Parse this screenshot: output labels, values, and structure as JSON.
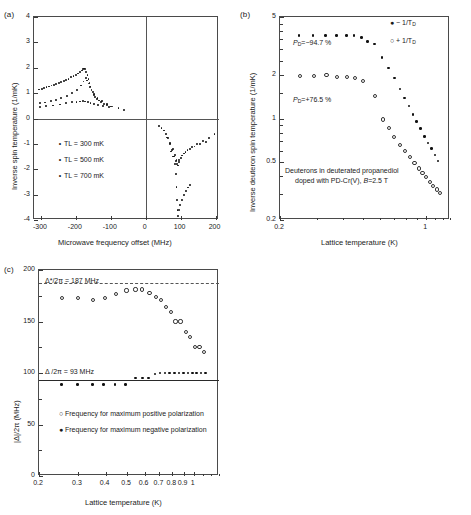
{
  "figure": {
    "panels": [
      "(a)",
      "(b)",
      "(c)"
    ]
  },
  "panel_a": {
    "tag": "(a)",
    "xlabel": "Microwave frequency offset (MHz)",
    "ylabel": "Inverse spin temperature (1/mK)",
    "xticks": [
      "-300",
      "-200",
      "-100",
      "0",
      "100",
      "200"
    ],
    "yticks": [
      "4",
      "3",
      "2",
      "1",
      "0",
      "-1",
      "-2",
      "-3",
      "-4"
    ],
    "legend": [
      {
        "marker": "dot",
        "label": "TL = 300 mK"
      },
      {
        "marker": "dot",
        "label": "TL = 500 mK"
      },
      {
        "marker": "dot",
        "label": "TL = 700 mK"
      }
    ]
  },
  "panel_b": {
    "tag": "(b)",
    "xlabel": "Lattice temperature (K)",
    "ylabel": "Inverse deuteron spin temperature (1/mK)",
    "xticks": [
      "0.2",
      "1"
    ],
    "yticks": [
      "5",
      "2",
      "1",
      "0.5",
      "0.2"
    ],
    "legend": [
      {
        "marker": "filled",
        "label": "− 1/T",
        "sub": "D"
      },
      {
        "marker": "open",
        "label": "+ 1/T",
        "sub": "D"
      }
    ],
    "annotations": {
      "neg_polarization": "P",
      "neg_polarization_sub": "D",
      "neg_polarization_val": "=−94.7 %",
      "pos_polarization": "P",
      "pos_polarization_sub": "D",
      "pos_polarization_val": "=+76.5 %",
      "caption_line1": "Deuterons in deuterated propanediol",
      "caption_line2_a": "doped with PD-Cr(V), ",
      "caption_line2_b": "B",
      "caption_line2_c": "=2.5 T"
    }
  },
  "panel_c": {
    "tag": "(c)",
    "xlabel": "Lattice temperature (K)",
    "ylabel": "|Δ|/2π  (MHz)",
    "xticks": [
      "0.2",
      "0.3",
      "0.4",
      "0.5",
      "0.6",
      "0.7",
      "0.8",
      "0.9",
      "1"
    ],
    "yticks": [
      "200",
      "150",
      "100",
      "50",
      "0"
    ],
    "annotations": {
      "upper_line": "Δ*/2π = 187 MHz",
      "lower_line": "Δ /2π = 93 MHz"
    },
    "legend": [
      {
        "marker": "open",
        "label": "Frequency for maximum positive polarization"
      },
      {
        "marker": "filled",
        "label": "Frequency for maximum negative polarization"
      }
    ]
  },
  "chart_data": [
    {
      "type": "scatter",
      "id": "panel_a",
      "title": "(a)",
      "xlabel": "Microwave frequency offset (MHz)",
      "ylabel": "Inverse spin temperature (1/mK)",
      "xlim": [
        -320,
        210
      ],
      "ylim": [
        -4,
        4
      ],
      "grid": false,
      "legend_position": "center-left",
      "series": [
        {
          "name": "TL = 300 mK",
          "marker": "dot",
          "points": [
            [
              -305,
              1.14
            ],
            [
              -298,
              1.17
            ],
            [
              -291,
              1.2
            ],
            [
              -284,
              1.23
            ],
            [
              -277,
              1.26
            ],
            [
              -270,
              1.3
            ],
            [
              -263,
              1.33
            ],
            [
              -256,
              1.37
            ],
            [
              -249,
              1.41
            ],
            [
              -242,
              1.45
            ],
            [
              -235,
              1.49
            ],
            [
              -228,
              1.53
            ],
            [
              -221,
              1.57
            ],
            [
              -214,
              1.62
            ],
            [
              -207,
              1.67
            ],
            [
              -200,
              1.72
            ],
            [
              -194,
              1.77
            ],
            [
              -188,
              1.83
            ],
            [
              -183,
              1.89
            ],
            [
              -179,
              1.94
            ],
            [
              -176,
              1.97
            ],
            [
              -173,
              1.95
            ],
            [
              -170,
              1.84
            ],
            [
              -167,
              1.7
            ],
            [
              -164,
              1.55
            ],
            [
              -161,
              1.4
            ],
            [
              -158,
              1.26
            ],
            [
              -155,
              1.14
            ],
            [
              -152,
              1.03
            ],
            [
              -149,
              0.94
            ],
            [
              -145,
              0.86
            ],
            [
              -140,
              0.78
            ],
            [
              -134,
              0.71
            ],
            [
              -127,
              0.64
            ],
            [
              -119,
              0.58
            ],
            [
              -110,
              0.52
            ],
            [
              -100,
              0.47
            ],
            [
              38,
              -0.28
            ],
            [
              45,
              -0.36
            ],
            [
              52,
              -0.47
            ],
            [
              58,
              -0.6
            ],
            [
              64,
              -0.78
            ],
            [
              70,
              -1.0
            ],
            [
              75,
              -1.25
            ],
            [
              79,
              -1.5
            ],
            [
              83,
              -1.8
            ],
            [
              86,
              -2.2
            ],
            [
              88,
              -2.7
            ],
            [
              90,
              -3.2
            ],
            [
              91,
              -3.6
            ],
            [
              92,
              -3.85
            ],
            [
              95,
              -3.6
            ],
            [
              99,
              -3.4
            ],
            [
              104,
              -3.2
            ],
            [
              110,
              -3.0
            ],
            [
              116,
              -2.85
            ],
            [
              122,
              -2.72
            ],
            [
              127,
              -2.62
            ]
          ]
        },
        {
          "name": "TL = 500 mK",
          "marker": "dot",
          "points": [
            [
              -302,
              0.6
            ],
            [
              -288,
              0.63
            ],
            [
              -272,
              0.68
            ],
            [
              -258,
              0.74
            ],
            [
              -242,
              0.81
            ],
            [
              -226,
              0.9
            ],
            [
              -210,
              1.02
            ],
            [
              -197,
              1.13
            ],
            [
              -186,
              1.3
            ],
            [
              -178,
              1.46
            ],
            [
              -172,
              1.6
            ],
            [
              -168,
              1.5
            ],
            [
              -164,
              1.38
            ],
            [
              -160,
              1.24
            ],
            [
              -155,
              1.1
            ],
            [
              -148,
              0.96
            ],
            [
              -138,
              0.82
            ],
            [
              -126,
              0.7
            ],
            [
              -112,
              0.58
            ],
            [
              -95,
              0.47
            ],
            [
              -78,
              0.4
            ],
            [
              -62,
              0.35
            ],
            [
              60,
              -0.75
            ],
            [
              70,
              -0.95
            ],
            [
              78,
              -1.2
            ],
            [
              84,
              -1.45
            ],
            [
              88,
              -1.65
            ],
            [
              92,
              -1.85
            ],
            [
              96,
              -1.72
            ],
            [
              102,
              -1.55
            ],
            [
              110,
              -1.38
            ],
            [
              120,
              -1.25
            ],
            [
              133,
              -1.12
            ],
            [
              148,
              -1.0
            ],
            [
              165,
              -0.88
            ],
            [
              182,
              -0.76
            ],
            [
              197,
              -0.62
            ]
          ]
        },
        {
          "name": "TL = 700 mK",
          "marker": "dot",
          "points": [
            [
              -303,
              0.46
            ],
            [
              -285,
              0.48
            ],
            [
              -265,
              0.51
            ],
            [
              -245,
              0.55
            ],
            [
              -228,
              0.6
            ],
            [
              -212,
              0.64
            ],
            [
              -198,
              0.66
            ],
            [
              -188,
              0.67
            ],
            [
              -180,
              0.68
            ],
            [
              -173,
              0.67
            ],
            [
              -166,
              0.65
            ],
            [
              -158,
              0.62
            ],
            [
              -148,
              0.58
            ],
            [
              -136,
              0.54
            ],
            [
              -122,
              0.5
            ],
            [
              -106,
              0.45
            ],
            [
              72,
              -1.3
            ],
            [
              80,
              -1.5
            ],
            [
              86,
              -1.68
            ],
            [
              90,
              -1.78
            ],
            [
              96,
              -1.62
            ],
            [
              104,
              -1.46
            ],
            [
              114,
              -1.32
            ],
            [
              126,
              -1.2
            ],
            [
              140,
              -1.1
            ],
            [
              156,
              -1.0
            ],
            [
              172,
              -0.92
            ]
          ]
        }
      ]
    },
    {
      "type": "scatter",
      "id": "panel_b",
      "title": "(b)",
      "xlabel": "Lattice temperature (K)",
      "ylabel": "Inverse deuteron spin temperature (1/mK)",
      "xscale": "log",
      "yscale": "log",
      "xlim": [
        0.2,
        1.3
      ],
      "ylim": [
        0.2,
        5
      ],
      "grid": false,
      "legend_position": "top-right",
      "series": [
        {
          "name": "- 1/T_D",
          "marker": "filled",
          "points": [
            [
              0.247,
              3.72
            ],
            [
              0.288,
              3.72
            ],
            [
              0.33,
              3.72
            ],
            [
              0.372,
              3.72
            ],
            [
              0.415,
              3.74
            ],
            [
              0.452,
              3.72
            ],
            [
              0.492,
              3.62
            ],
            [
              0.525,
              3.38
            ],
            [
              0.565,
              3.25
            ],
            [
              0.615,
              2.62
            ],
            [
              0.662,
              2.22
            ],
            [
              0.705,
              1.9
            ],
            [
              0.748,
              1.6
            ],
            [
              0.79,
              1.38
            ],
            [
              0.828,
              1.22
            ],
            [
              0.865,
              1.07
            ],
            [
              0.9,
              0.95
            ],
            [
              0.94,
              0.85
            ],
            [
              0.98,
              0.75
            ],
            [
              1.02,
              0.68
            ],
            [
              1.06,
              0.62
            ],
            [
              1.1,
              0.56
            ],
            [
              1.14,
              0.51
            ]
          ]
        },
        {
          "name": "+ 1/T_D",
          "marker": "open",
          "points": [
            [
              0.247,
              1.99
            ],
            [
              0.288,
              1.99
            ],
            [
              0.33,
              2.02
            ],
            [
              0.372,
              1.97
            ],
            [
              0.415,
              1.97
            ],
            [
              0.452,
              1.92
            ],
            [
              0.492,
              1.85
            ],
            [
              0.565,
              1.45
            ],
            [
              0.615,
              1.0
            ],
            [
              0.655,
              0.87
            ],
            [
              0.695,
              0.76
            ],
            [
              0.74,
              0.67
            ],
            [
              0.785,
              0.61
            ],
            [
              0.83,
              0.55
            ],
            [
              0.87,
              0.5
            ],
            [
              0.912,
              0.46
            ],
            [
              0.95,
              0.43
            ],
            [
              0.99,
              0.4
            ],
            [
              1.03,
              0.37
            ],
            [
              1.07,
              0.35
            ],
            [
              1.11,
              0.33
            ],
            [
              1.15,
              0.31
            ]
          ]
        }
      ]
    },
    {
      "type": "scatter",
      "id": "panel_c",
      "title": "(c)",
      "xlabel": "Lattice temperature (K)",
      "ylabel": "|Δ|/2π  (MHz)",
      "xscale": "log",
      "yscale": "linear",
      "xlim": [
        0.2,
        1.3
      ],
      "ylim": [
        0,
        200
      ],
      "grid": false,
      "legend_position": "center",
      "reference_lines": [
        {
          "label": "Δ*/2π = 187 MHz",
          "value": 187,
          "style": "dashed"
        },
        {
          "label": "Δ /2π = 93 MHz",
          "value": 93,
          "style": "solid"
        }
      ],
      "series": [
        {
          "name": "Frequency for maximum positive polarization",
          "marker": "open",
          "points": [
            [
              0.252,
              174
            ],
            [
              0.298,
              174
            ],
            [
              0.348,
              172
            ],
            [
              0.392,
              174
            ],
            [
              0.44,
              178
            ],
            [
              0.492,
              181
            ],
            [
              0.54,
              182
            ],
            [
              0.58,
              182
            ],
            [
              0.625,
              179
            ],
            [
              0.668,
              175
            ],
            [
              0.705,
              172
            ],
            [
              0.742,
              165
            ],
            [
              0.778,
              160
            ],
            [
              0.818,
              151
            ],
            [
              0.862,
              151
            ],
            [
              0.91,
              141
            ],
            [
              0.955,
              136
            ],
            [
              1.0,
              126
            ],
            [
              1.05,
              126
            ],
            [
              1.1,
              121
            ]
          ]
        },
        {
          "name": "Frequency for maximum negative polarization",
          "marker": "filled",
          "points": [
            [
              0.252,
              89
            ],
            [
              0.298,
              89
            ],
            [
              0.348,
              89
            ],
            [
              0.392,
              89
            ],
            [
              0.44,
              89
            ],
            [
              0.492,
              89
            ],
            [
              0.545,
              95
            ],
            [
              0.585,
              95
            ],
            [
              0.625,
              95
            ],
            [
              0.668,
              99
            ],
            [
              0.705,
              100
            ],
            [
              0.742,
              100
            ],
            [
              0.778,
              100
            ],
            [
              0.818,
              100
            ],
            [
              0.858,
              100
            ],
            [
              0.898,
              100
            ],
            [
              0.94,
              100
            ],
            [
              0.985,
              100
            ],
            [
              1.03,
              100
            ],
            [
              1.08,
              100
            ],
            [
              1.13,
              100
            ]
          ]
        }
      ]
    }
  ]
}
